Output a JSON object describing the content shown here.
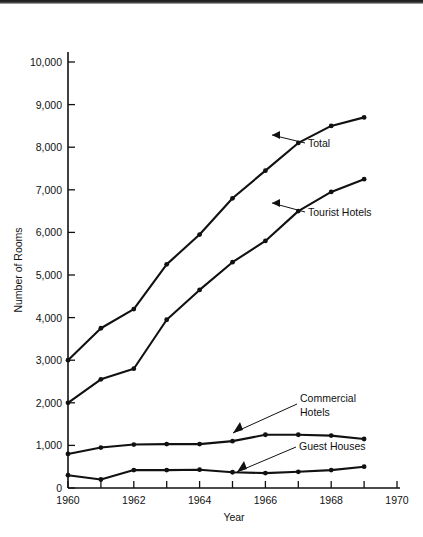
{
  "chart_data": {
    "type": "line",
    "title": "",
    "xlabel": "Year",
    "ylabel": "Number of Rooms",
    "x": [
      1960,
      1961,
      1962,
      1963,
      1964,
      1965,
      1966,
      1967,
      1968,
      1969
    ],
    "xlim": [
      1960,
      1970
    ],
    "ylim": [
      0,
      10500
    ],
    "grid": false,
    "legend_position": "inline-annotations",
    "y_ticks": [
      0,
      1000,
      2000,
      3000,
      4000,
      5000,
      6000,
      7000,
      8000,
      9000,
      10000
    ],
    "y_tick_labels": [
      "0",
      "1,000",
      "2,000",
      "3,000",
      "4,000",
      "5,000",
      "6,000",
      "7,000",
      "8,000",
      "9,000",
      "10,000"
    ],
    "x_ticks": [
      1960,
      1961,
      1962,
      1963,
      1964,
      1965,
      1966,
      1967,
      1968,
      1969,
      1970
    ],
    "x_tick_labels": [
      "1960",
      "",
      "1962",
      "",
      "1964",
      "",
      "1966",
      "",
      "1968",
      "",
      "1970"
    ],
    "series": [
      {
        "name": "Total",
        "values": [
          3000,
          3750,
          4200,
          5250,
          5950,
          6800,
          7450,
          8100,
          8500,
          8700
        ],
        "annotation": "Total"
      },
      {
        "name": "Tourist Hotels",
        "values": [
          2000,
          2550,
          2800,
          3950,
          4650,
          5300,
          5800,
          6500,
          6950,
          7250
        ],
        "annotation": "Tourist Hotels"
      },
      {
        "name": "Commercial Hotels",
        "values": [
          800,
          950,
          1020,
          1030,
          1030,
          1100,
          1250,
          1250,
          1230,
          1150
        ],
        "annotation": "Commercial Hotels"
      },
      {
        "name": "Guest Houses",
        "values": [
          300,
          200,
          420,
          420,
          430,
          370,
          350,
          380,
          420,
          500
        ],
        "annotation": "Guest Houses"
      }
    ],
    "annotations": [
      {
        "text": "Total",
        "x": 1967,
        "y": 8100
      },
      {
        "text": "Tourist Hotels",
        "x": 1967,
        "y": 6500
      },
      {
        "text": "Commercial Hotels",
        "x": 1966,
        "y": 1250
      },
      {
        "text": "Guest Houses",
        "x": 1966,
        "y": 350
      }
    ],
    "colors": {
      "line": "#111111",
      "background": "#ffffff"
    }
  },
  "labels": {
    "annotation_commercial_line1": "Commercial",
    "annotation_commercial_line2": "Hotels"
  }
}
